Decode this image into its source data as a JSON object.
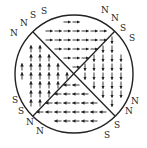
{
  "diagram": {
    "colors": {
      "stroke": "#222222",
      "background": "#ffffff"
    },
    "domains": [
      {
        "name": "top",
        "arrow_direction": "right"
      },
      {
        "name": "right",
        "arrow_direction": "down"
      },
      {
        "name": "bottom",
        "arrow_direction": "left"
      },
      {
        "name": "left",
        "arrow_direction": "up"
      }
    ],
    "pole_labels": [
      {
        "corner": "top-left",
        "labels": [
          "S",
          "S",
          "N",
          "N",
          "N"
        ]
      },
      {
        "corner": "top-right",
        "labels": [
          "N",
          "N",
          "S",
          "S"
        ]
      },
      {
        "corner": "bottom-left",
        "labels": [
          "S",
          "S",
          "N",
          "N"
        ]
      },
      {
        "corner": "bottom-right",
        "labels": [
          "N",
          "N",
          "S",
          "S"
        ]
      }
    ]
  }
}
